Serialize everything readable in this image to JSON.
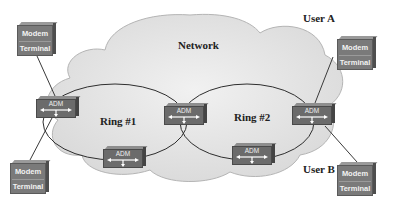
{
  "network": {
    "label": "Network"
  },
  "rings": [
    {
      "id": "ring-1",
      "label": "Ring #1"
    },
    {
      "id": "ring-2",
      "label": "Ring #2"
    }
  ],
  "users": [
    {
      "id": "user-a",
      "label": "User A"
    },
    {
      "id": "user-b",
      "label": "User B"
    }
  ],
  "endpoints": [
    {
      "id": "endpoint-top-left",
      "top_label": "Modem",
      "bottom_label": "Terminal"
    },
    {
      "id": "endpoint-bottom-left",
      "top_label": "Modem",
      "bottom_label": "Terminal"
    },
    {
      "id": "endpoint-user-a",
      "top_label": "Modem",
      "bottom_label": "Terminal"
    },
    {
      "id": "endpoint-user-b",
      "top_label": "Modem",
      "bottom_label": "Terminal"
    }
  ],
  "adms": [
    {
      "id": "adm-ring1-left",
      "label": "ADM"
    },
    {
      "id": "adm-shared",
      "label": "ADM"
    },
    {
      "id": "adm-ring1-bottom",
      "label": "ADM"
    },
    {
      "id": "adm-ring2-bottom",
      "label": "ADM"
    },
    {
      "id": "adm-ring2-right",
      "label": "ADM"
    }
  ],
  "colors": {
    "cloud_fill": "#e6e6e6",
    "cloud_stroke": "#b5b5b5",
    "ring_stroke": "#2e2e2e",
    "device_fill": "#6b6b6b",
    "link_stroke": "#3a3a3a"
  }
}
